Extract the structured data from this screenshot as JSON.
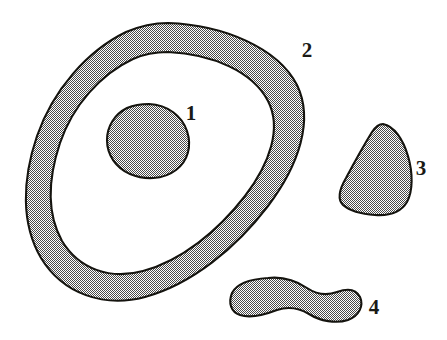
{
  "figure": {
    "kind": "line-art-diagram",
    "width": 447,
    "height": 340,
    "background_color": "#ffffff",
    "outline_color": "#15140f",
    "fill_color": "#9a9a9a",
    "fill_style": "fine-checkerboard-dither",
    "label_color": "#1a1a16"
  },
  "regions": [
    {
      "id": "region-1",
      "label": "1",
      "shape_name": "inner-blob",
      "description": "rounded egg-shaped blob inside the ring",
      "label_x": 191,
      "label_y": 115,
      "bbox": [
        107,
        104,
        189,
        178
      ]
    },
    {
      "id": "region-2",
      "label": "2",
      "shape_name": "annulus-ring",
      "description": "large tilted elliptical ring band enclosing region 1",
      "label_x": 307,
      "label_y": 52,
      "bbox": [
        24,
        22,
        306,
        300
      ]
    },
    {
      "id": "region-3",
      "label": "3",
      "shape_name": "teardrop-wedge",
      "description": "rounded triangular wedge at right",
      "label_x": 421,
      "label_y": 170,
      "bbox": [
        339,
        124,
        413,
        216
      ]
    },
    {
      "id": "region-4",
      "label": "4",
      "shape_name": "peanut-blob",
      "description": "elongated peanut / dumbbell shape with central waist",
      "label_x": 374,
      "label_y": 309,
      "bbox": [
        231,
        276,
        362,
        322
      ]
    }
  ]
}
